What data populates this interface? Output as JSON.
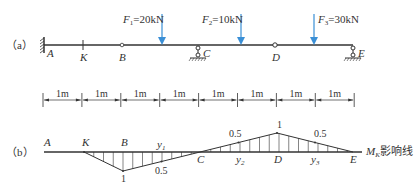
{
  "figure_a": {
    "panel_label": "（a）",
    "points": [
      "A",
      "K",
      "B",
      "C",
      "D",
      "E"
    ],
    "supports": {
      "A": "fixed",
      "C": "roller",
      "E": "roller"
    },
    "hinges": [
      "B",
      "D"
    ],
    "section": "K",
    "forces": [
      {
        "name": "F",
        "sub": "1",
        "value": "=20kN",
        "color": "#3a8fd6"
      },
      {
        "name": "F",
        "sub": "2",
        "value": "=10kN",
        "color": "#3a8fd6"
      },
      {
        "name": "F",
        "sub": "3",
        "value": "=30kN",
        "color": "#3a8fd6"
      }
    ]
  },
  "dimensions": {
    "segments": [
      "1m",
      "1m",
      "1m",
      "1m",
      "1m",
      "1m",
      "1m",
      "1m"
    ]
  },
  "figure_b": {
    "panel_label": "（b）",
    "points": [
      "A",
      "K",
      "B",
      "C",
      "D",
      "E"
    ],
    "ordinates": [
      {
        "label": "1",
        "at": "B",
        "value": -1
      },
      {
        "label": "0.5",
        "value": -0.5
      },
      {
        "label": "0.5",
        "value": 0.5
      },
      {
        "label": "1",
        "at": "D",
        "value": 1
      },
      {
        "label": "0.5",
        "value": 0.5
      }
    ],
    "y_labels": [
      {
        "name": "y",
        "sub": "1"
      },
      {
        "name": "y",
        "sub": "2"
      },
      {
        "name": "y",
        "sub": "3"
      }
    ],
    "caption": {
      "name": "M",
      "sub": "K",
      "text": "影响线"
    }
  }
}
